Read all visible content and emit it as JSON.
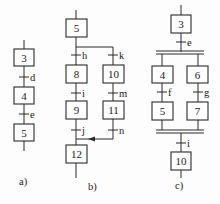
{
  "diagram": {
    "type": "SFC / GRAFCET examples",
    "panels": [
      {
        "id": "a",
        "caption": "a)",
        "structure": "single sequence",
        "steps": [
          "3",
          "4",
          "5"
        ],
        "transitions": [
          "d",
          "e"
        ]
      },
      {
        "id": "b",
        "caption": "b)",
        "structure": "selective (alternative) branch",
        "steps": [
          "5",
          "8",
          "9",
          "10",
          "11",
          "12"
        ],
        "transitions": [
          "h",
          "i",
          "j",
          "k",
          "m",
          "n"
        ],
        "branches": [
          {
            "path": [
              "5",
              "h",
              "8",
              "i",
              "9",
              "j",
              "12"
            ]
          },
          {
            "path": [
              "5",
              "k",
              "10",
              "m",
              "11",
              "n",
              "12"
            ]
          }
        ]
      },
      {
        "id": "c",
        "caption": "c)",
        "structure": "simultaneous (parallel) branch",
        "steps": [
          "3",
          "4",
          "5",
          "6",
          "7",
          "10"
        ],
        "transitions": [
          "e",
          "f",
          "g",
          "i"
        ],
        "branches": [
          {
            "path": [
              "4",
              "f",
              "5"
            ]
          },
          {
            "path": [
              "6",
              "g",
              "7"
            ]
          }
        ]
      }
    ]
  },
  "a": {
    "step1": "3",
    "step2": "4",
    "step3": "5",
    "t1": "d",
    "t2": "e",
    "caption": "a)"
  },
  "b": {
    "step5": "5",
    "step8": "8",
    "step9": "9",
    "step10": "10",
    "step11": "11",
    "step12": "12",
    "th": "h",
    "ti": "i",
    "tj": "j",
    "tk": "k",
    "tm": "m",
    "tn": "n",
    "caption": "b)"
  },
  "c": {
    "step3": "3",
    "step4": "4",
    "step5": "5",
    "step6": "6",
    "step7": "7",
    "step10": "10",
    "te": "e",
    "tf": "f",
    "tg": "g",
    "ti": "i",
    "caption": "c)"
  },
  "colors": {
    "line": "#2a2a2a",
    "background": "#fdfdfd"
  }
}
